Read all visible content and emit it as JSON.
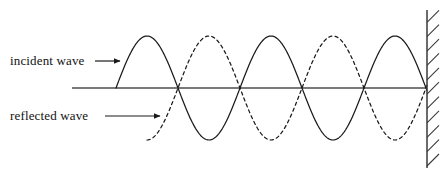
{
  "figure": {
    "background_color": "#ffffff",
    "width": 445,
    "height": 179
  },
  "labels": {
    "incident": "incident wave",
    "reflected": "reflected wave"
  },
  "colors": {
    "stroke": "#1a1a1a",
    "axis": "#4d4d4d",
    "wall": "#3a3a3a",
    "text": "#121212"
  },
  "chart_data": {
    "type": "line",
    "title": "",
    "xlabel": "",
    "ylabel": "",
    "grid": false,
    "legend": "inline-labels-with-arrows",
    "axis": {
      "baseline_y": 88,
      "x_start": 72,
      "x_end": 427
    },
    "wall": {
      "x": 427,
      "y_top": 10,
      "y_bottom": 168,
      "hatch_count": 11,
      "hatch_side": "right",
      "hatch_angle_deg": 45
    },
    "series": [
      {
        "name": "incident wave",
        "style": "solid",
        "amplitude": 52,
        "wavelength": 124,
        "phase": "sine-positive-first",
        "x_start": 116,
        "x_end": 427,
        "crest_x": [
          147,
          271,
          395
        ],
        "trough_x": [
          209,
          333
        ],
        "zero_crossings": [
          116,
          178,
          240,
          302,
          364,
          427
        ]
      },
      {
        "name": "reflected wave",
        "style": "dashed",
        "amplitude": 52,
        "wavelength": 124,
        "phase": "sine-negative-first",
        "x_start": 147,
        "x_end": 427,
        "crest_x": [
          209,
          333
        ],
        "trough_x": [
          147,
          271,
          395
        ],
        "zero_crossings": [
          178,
          240,
          302,
          364,
          427
        ]
      }
    ],
    "annotations": [
      {
        "text": "incident wave",
        "text_x": 10,
        "text_y": 61,
        "arrow_from_x": 95,
        "arrow_to_x": 120,
        "arrow_y": 61,
        "points_to": "incident wave"
      },
      {
        "text": "reflected wave",
        "text_x": 10,
        "text_y": 116,
        "arrow_from_x": 105,
        "arrow_to_x": 160,
        "arrow_y": 116,
        "points_to": "reflected wave"
      }
    ]
  }
}
